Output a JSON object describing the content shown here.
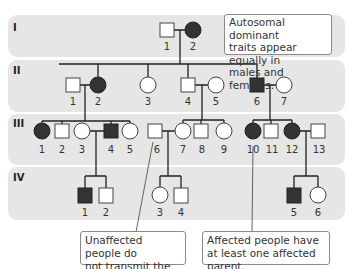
{
  "diagram": {
    "type": "pedigree",
    "trait": "Autosomal dominant",
    "colors": {
      "band": "#e6e6e6",
      "affected": "#333333",
      "unaffected": "#ffffff",
      "line": "#222222"
    },
    "generations": [
      {
        "label": "I",
        "individuals": [
          {
            "id": "1",
            "sex": "male",
            "affected": false
          },
          {
            "id": "2",
            "sex": "female",
            "affected": true
          }
        ]
      },
      {
        "label": "II",
        "individuals": [
          {
            "id": "1",
            "sex": "male",
            "affected": false
          },
          {
            "id": "2",
            "sex": "female",
            "affected": true
          },
          {
            "id": "3",
            "sex": "female",
            "affected": false
          },
          {
            "id": "4",
            "sex": "male",
            "affected": false
          },
          {
            "id": "5",
            "sex": "female",
            "affected": false
          },
          {
            "id": "6",
            "sex": "male",
            "affected": true
          },
          {
            "id": "7",
            "sex": "female",
            "affected": false
          }
        ]
      },
      {
        "label": "III",
        "individuals": [
          {
            "id": "1",
            "sex": "female",
            "affected": true
          },
          {
            "id": "2",
            "sex": "male",
            "affected": false
          },
          {
            "id": "3",
            "sex": "female",
            "affected": false
          },
          {
            "id": "4",
            "sex": "male",
            "affected": true
          },
          {
            "id": "5",
            "sex": "female",
            "affected": false
          },
          {
            "id": "6",
            "sex": "male",
            "affected": false
          },
          {
            "id": "7",
            "sex": "female",
            "affected": false
          },
          {
            "id": "8",
            "sex": "male",
            "affected": false
          },
          {
            "id": "9",
            "sex": "female",
            "affected": false
          },
          {
            "id": "10",
            "sex": "female",
            "affected": true
          },
          {
            "id": "11",
            "sex": "male",
            "affected": false
          },
          {
            "id": "12",
            "sex": "female",
            "affected": true
          },
          {
            "id": "13",
            "sex": "male",
            "affected": false
          }
        ]
      },
      {
        "label": "IV",
        "individuals": [
          {
            "id": "1",
            "sex": "male",
            "affected": true
          },
          {
            "id": "2",
            "sex": "male",
            "affected": false
          },
          {
            "id": "3",
            "sex": "female",
            "affected": false
          },
          {
            "id": "4",
            "sex": "male",
            "affected": false
          },
          {
            "id": "5",
            "sex": "male",
            "affected": true
          },
          {
            "id": "6",
            "sex": "female",
            "affected": false
          }
        ]
      }
    ],
    "callouts": {
      "top": "Autosomal dominant\ntraits appear equally in\nmales and females.",
      "bottom_left": "Unaffected people do\nnot transmit the trait.",
      "bottom_right": "Affected people have\nat least one affected parent."
    }
  }
}
